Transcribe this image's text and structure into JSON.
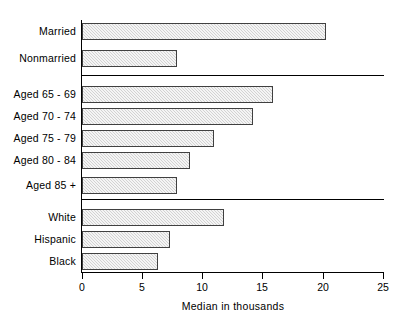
{
  "chart_data": {
    "type": "bar",
    "orientation": "horizontal",
    "title": "",
    "xlabel": "Median in thousands",
    "ylabel": "",
    "xlim": [
      0,
      25
    ],
    "xticks": [
      0,
      5,
      10,
      15,
      20,
      25
    ],
    "xtick_labels": [
      "0",
      "5",
      "10",
      "15",
      "20",
      "25"
    ],
    "grid": false,
    "legend": null,
    "bar_color": "#d2d2d2",
    "bar_edge_color": "#404040",
    "groups": [
      {
        "name": "Marital status",
        "categories": [
          "Married",
          "Nonmarried"
        ],
        "values": [
          20.3,
          7.9
        ]
      },
      {
        "name": "Age",
        "categories": [
          "Aged 65 - 69",
          "Aged 70 - 74",
          "Aged 75 - 79",
          "Aged 80 - 84",
          "Aged 85 +"
        ],
        "values": [
          15.9,
          14.2,
          11.0,
          9.0,
          7.9
        ]
      },
      {
        "name": "Race and ethnicity",
        "categories": [
          "White",
          "Hispanic",
          "Black"
        ],
        "values": [
          11.8,
          7.3,
          6.3
        ]
      }
    ],
    "categories": [
      "Married",
      "Nonmarried",
      "Aged 65 - 69",
      "Aged 70 - 74",
      "Aged 75 - 79",
      "Aged 80 - 84",
      "Aged 85 +",
      "White",
      "Hispanic",
      "Black"
    ],
    "values": [
      20.3,
      7.9,
      15.9,
      14.2,
      11.0,
      9.0,
      7.9,
      11.8,
      7.3,
      6.3
    ]
  },
  "bars": [
    {
      "label": "Married",
      "value": 20.3,
      "top": 23,
      "width_px": 244
    },
    {
      "label": "Nonmarried",
      "value": 7.9,
      "top": 50,
      "width_px": 95
    },
    {
      "label": "Aged 65 - 69",
      "value": 15.9,
      "top": 86,
      "width_px": 191
    },
    {
      "label": "Aged 70 - 74",
      "value": 14.2,
      "top": 108,
      "width_px": 171
    },
    {
      "label": "Aged 75 - 79",
      "value": 11.0,
      "top": 130,
      "width_px": 132
    },
    {
      "label": "Aged 80 - 84",
      "value": 9.0,
      "top": 152,
      "width_px": 108
    },
    {
      "label": "Aged 85 +",
      "value": 7.9,
      "top": 177,
      "width_px": 95
    },
    {
      "label": "White",
      "value": 11.8,
      "top": 209,
      "width_px": 142
    },
    {
      "label": "Hispanic",
      "value": 7.3,
      "top": 231,
      "width_px": 88
    },
    {
      "label": "Black",
      "value": 6.3,
      "top": 253,
      "width_px": 76
    }
  ],
  "separators": [
    {
      "top": 75
    },
    {
      "top": 199
    }
  ],
  "ticks": [
    {
      "label": "0",
      "left": 82
    },
    {
      "label": "5",
      "left": 142
    },
    {
      "label": "10",
      "left": 202
    },
    {
      "label": "15",
      "left": 262
    },
    {
      "label": "20",
      "left": 323
    },
    {
      "label": "25",
      "left": 383
    }
  ],
  "axis": {
    "title": "Median in thousands"
  }
}
